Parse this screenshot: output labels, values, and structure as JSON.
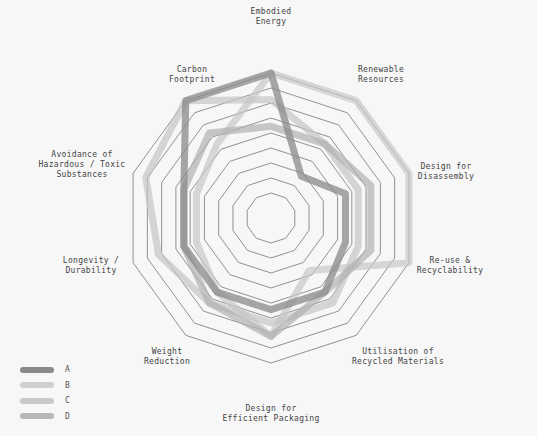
{
  "chart_data": {
    "type": "radar",
    "title": "",
    "axes": [
      "Embodied Energy",
      "Renewable Resources",
      "Design for Disassembly",
      "Re-use & Recyclability",
      "Utilisation of Recycled Materials",
      "Design for Efficient Packaging",
      "Weight Reduction",
      "Longevity / Durability",
      "Avoidance of Hazardous / Toxic Substances",
      "Carbon Footprint"
    ],
    "axis_label_lines": [
      [
        "Embodied",
        "Energy"
      ],
      [
        "Renewable",
        "Resources"
      ],
      [
        "Design for",
        "Disassembly"
      ],
      [
        "Re-use &",
        "Recyclability"
      ],
      [
        "Utilisation of",
        "Recycled Materials"
      ],
      [
        "Design for",
        "Efficient Packaging"
      ],
      [
        "Weight",
        "Reduction"
      ],
      [
        "Longevity /",
        "Durability"
      ],
      [
        "Avoidance of",
        "Hazardous / Toxic",
        "Substances"
      ],
      [
        "Carbon",
        "Footprint"
      ]
    ],
    "scale": {
      "min": 0,
      "max": 10,
      "rings": 9
    },
    "series": [
      {
        "name": "A",
        "color": "#8a8a8a",
        "values": [
          10,
          3,
          5,
          5,
          6,
          6,
          6,
          6,
          6,
          10
        ]
      },
      {
        "name": "B",
        "color": "#c8c8c8",
        "values": [
          10,
          10,
          10,
          10,
          4,
          8,
          6,
          5,
          5,
          6
        ]
      },
      {
        "name": "C",
        "color": "#c4c4c4",
        "values": [
          8,
          6,
          6,
          6,
          7,
          7,
          7,
          8,
          9,
          10
        ]
      },
      {
        "name": "D",
        "color": "#b0b0b0",
        "values": [
          6,
          6,
          7,
          7,
          6,
          8,
          7,
          6,
          6,
          7
        ]
      }
    ],
    "legend_position": "bottom-left",
    "grid": true
  },
  "legend": {
    "items": [
      {
        "label": "A",
        "color": "#8a8a8a"
      },
      {
        "label": "B",
        "color": "#cfcfcf"
      },
      {
        "label": "C",
        "color": "#c9c9c9"
      },
      {
        "label": "D",
        "color": "#b7b7b7"
      }
    ]
  }
}
